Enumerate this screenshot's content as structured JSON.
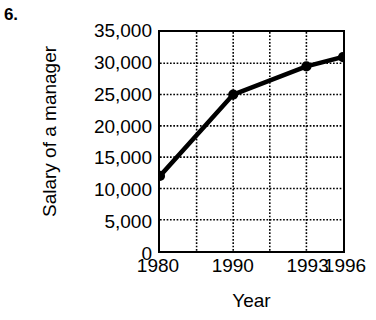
{
  "problem": {
    "number_label": "6."
  },
  "chart_data": {
    "type": "line",
    "title": "",
    "xlabel": "Year",
    "ylabel": "Salary of a manager",
    "categories": [
      "1980",
      "1990",
      "1993",
      "1996"
    ],
    "values": [
      12000,
      25000,
      29500,
      31000
    ],
    "series": [
      {
        "name": "Salary of a manager",
        "values": [
          12000,
          25000,
          29500,
          31000
        ]
      }
    ],
    "points": [
      {
        "x_label": "1980",
        "x_pos": 0.0,
        "value": 12000
      },
      {
        "x_label": "1990",
        "x_pos": 0.4,
        "value": 25000
      },
      {
        "x_label": "1993",
        "x_pos": 0.8,
        "value": 29500
      },
      {
        "x_label": "1996",
        "x_pos": 1.0,
        "value": 31000
      }
    ],
    "ylim": [
      0,
      35000
    ],
    "ytick_labels": [
      "0",
      "5,000",
      "10,000",
      "15,000",
      "20,000",
      "25,000",
      "30,000",
      "35,000"
    ],
    "ytick_values": [
      0,
      5000,
      10000,
      15000,
      20000,
      25000,
      30000,
      35000
    ],
    "xtick_labels": [
      "1980",
      "1990",
      "1993",
      "1996"
    ],
    "xtick_positions": [
      0.0,
      0.4,
      0.8,
      1.0
    ],
    "grid": true,
    "grid_style": "dotted",
    "vertical_gridline_positions": [
      0.2,
      0.4,
      0.6,
      0.8,
      1.0
    ],
    "legend": "none",
    "line_color": "#000000",
    "marker_color": "#000000",
    "grid_color": "#000000",
    "frame_color": "#000000",
    "background_color": "#ffffff"
  }
}
